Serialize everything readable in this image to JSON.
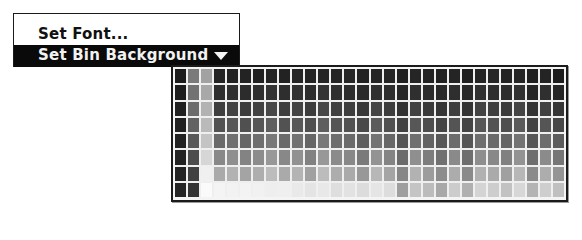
{
  "menu": {
    "items": [
      {
        "label": "Set Font...",
        "highlighted": false
      },
      {
        "label": "Set Bin Background",
        "highlighted": true,
        "icon": "triangle-down-icon"
      }
    ]
  },
  "bin": {
    "columns": 30,
    "rows": 8,
    "colors": [
      [
        "#1c1c1c",
        "#7a7a7a",
        "#a2a2a2",
        "#242424",
        "#222222",
        "#232323",
        "#212121",
        "#242424",
        "#222222",
        "#252525",
        "#232323",
        "#252525",
        "#242424",
        "#262626",
        "#222222",
        "#252525",
        "#242424",
        "#202020",
        "#252525",
        "#232323",
        "#222222",
        "#242424",
        "#1f1f1f",
        "#242424",
        "#262626",
        "#232323",
        "#252525",
        "#202020",
        "#242424",
        "#1e1e1e"
      ],
      [
        "#1e1e1e",
        "#727272",
        "#a8a8a8",
        "#2e2e2e",
        "#303030",
        "#2c2c2c",
        "#2f2f2f",
        "#333333",
        "#2e2e2e",
        "#313131",
        "#2c2c2c",
        "#333333",
        "#2f2f2f",
        "#2d2d2d",
        "#2a2a2a",
        "#303030",
        "#2d2d2d",
        "#262626",
        "#2f2f2f",
        "#2b2b2b",
        "#292929",
        "#2e2e2e",
        "#282828",
        "#303030",
        "#2e2e2e",
        "#2c2c2c",
        "#313131",
        "#262626",
        "#2f2f2f",
        "#262626"
      ],
      [
        "#1f1f1f",
        "#6c6c6c",
        "#b2b2b2",
        "#3e3e3e",
        "#424242",
        "#3c3c3c",
        "#414141",
        "#474747",
        "#3e3e3e",
        "#434343",
        "#3c3c3c",
        "#474747",
        "#404040",
        "#3e3e3e",
        "#383838",
        "#454545",
        "#3d3d3d",
        "#323232",
        "#424242",
        "#3a3a3a",
        "#353535",
        "#3f3f3f",
        "#343434",
        "#424242",
        "#3f3f3f",
        "#3b3b3b",
        "#444444",
        "#333333",
        "#404040",
        "#363636"
      ],
      [
        "#202020",
        "#626262",
        "#bababa",
        "#525252",
        "#575757",
        "#505050",
        "#565656",
        "#5e5e5e",
        "#525252",
        "#585858",
        "#4f4f4f",
        "#5e5e5e",
        "#555555",
        "#525252",
        "#4a4a4a",
        "#5b5b5b",
        "#505050",
        "#424242",
        "#575757",
        "#4d4d4d",
        "#454545",
        "#545454",
        "#444444",
        "#575757",
        "#535353",
        "#4e4e4e",
        "#5a5a5a",
        "#434343",
        "#555555",
        "#484848"
      ],
      [
        "#212121",
        "#585858",
        "#c4c4c4",
        "#6a6a6a",
        "#707070",
        "#666666",
        "#6e6e6e",
        "#787878",
        "#6a6a6a",
        "#727272",
        "#656565",
        "#787878",
        "#6d6d6d",
        "#6a6a6a",
        "#5f5f5f",
        "#747474",
        "#676767",
        "#545454",
        "#707070",
        "#626262",
        "#575757",
        "#6c6c6c",
        "#565656",
        "#6f6f6f",
        "#6a6a6a",
        "#646464",
        "#737373",
        "#565656",
        "#6d6d6d",
        "#5c5c5c"
      ],
      [
        "#222222",
        "#4c4c4c",
        "#d6d6d6",
        "#888888",
        "#8f8f8f",
        "#838383",
        "#8c8c8c",
        "#989898",
        "#888888",
        "#919191",
        "#818181",
        "#989898",
        "#8b8b8b",
        "#888888",
        "#7a7a7a",
        "#939393",
        "#848484",
        "#6b6b6b",
        "#8f8f8f",
        "#7d7d7d",
        "#707070",
        "#8a8a8a",
        "#6e6e6e",
        "#8e8e8e",
        "#888888",
        "#808080",
        "#939393",
        "#6e6e6e",
        "#8b8b8b",
        "#767676"
      ],
      [
        "#232323",
        "#404040",
        "#f0f0f0",
        "#aaaaaa",
        "#b2b2b2",
        "#a4a4a4",
        "#aeaeae",
        "#bcbcbc",
        "#aaaaaa",
        "#b4b4b4",
        "#a1a1a1",
        "#bcbcbc",
        "#adadad",
        "#aaaaaa",
        "#989898",
        "#b7b7b7",
        "#a5a5a5",
        "#868686",
        "#b2b2b2",
        "#9c9c9c",
        "#8c8c8c",
        "#acacac",
        "#8a8a8a",
        "#b1b1b1",
        "#aaaaaa",
        "#a0a0a0",
        "#b7b7b7",
        "#8a8a8a",
        "#adadad",
        "#949494"
      ],
      [
        "#242424",
        "#343434",
        "#fafafa",
        "#f4f4f4",
        "#f2f2f2",
        "#f3f3f3",
        "#f1f1f1",
        "#eeeeee",
        "#efefef",
        "#e9e9e9",
        "#e4e4e4",
        "#e8e8e8",
        "#dedede",
        "#e2e2e2",
        "#dcdcdc",
        "#e5e5e5",
        "#dddddd",
        "#9e9e9e",
        "#c4c4c4",
        "#bcbcbc",
        "#a8a8a8",
        "#cccccc",
        "#b0b0b0",
        "#d4d4d4",
        "#cdcdcd",
        "#c2c2c2",
        "#d7d7d7",
        "#b4b4b4",
        "#cecece",
        "#c0c0c0"
      ]
    ]
  }
}
